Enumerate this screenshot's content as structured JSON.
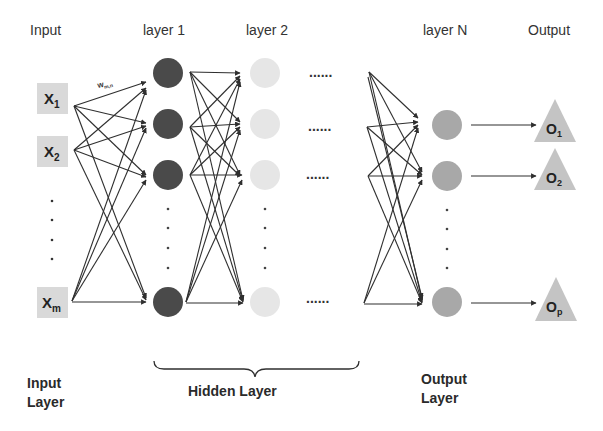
{
  "headers": {
    "input": "Input",
    "layer1": "layer 1",
    "layer2": "layer 2",
    "layerN": "layer N",
    "output": "Output"
  },
  "inputs": [
    {
      "label": "X",
      "sub": "1"
    },
    {
      "label": "X",
      "sub": "2"
    },
    {
      "label": "X",
      "sub": "m"
    }
  ],
  "outputs": [
    {
      "label": "O",
      "sub": "1"
    },
    {
      "label": "O",
      "sub": "2"
    },
    {
      "label": "O",
      "sub": "p"
    }
  ],
  "weight_label": {
    "label": "w",
    "sub": "m,n"
  },
  "ellipsis": "......",
  "bottom_labels": {
    "input_line1": "Input",
    "input_line2": "Layer",
    "hidden": "Hidden Layer",
    "output_line1": "Output",
    "output_line2": "Layer"
  },
  "colors": {
    "layer1_node": "#4a4a4a",
    "layer2_node": "#e6e6e6",
    "layerN_node": "#a8a8a8",
    "input_box": "#d9d9d9",
    "output_triangle": "#c4c4c4",
    "edge": "#2f2f2f"
  }
}
